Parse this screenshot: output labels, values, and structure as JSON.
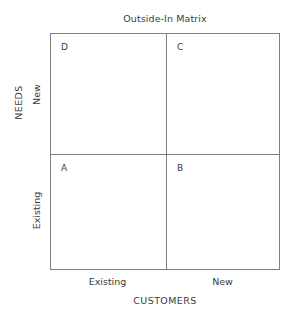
{
  "chart_data": {
    "type": "table",
    "title": "Outside-In Matrix",
    "xlabel": "CUSTOMERS",
    "ylabel": "NEEDS",
    "x_ticks": [
      "Existing",
      "New"
    ],
    "y_ticks": [
      "Existing",
      "New"
    ],
    "grid": true,
    "legend": null,
    "colors": {
      "border": "#808080",
      "text": "#3b3b3b",
      "background": "#ffffff"
    },
    "quadrants": [
      {
        "id": "top-left",
        "label": "D",
        "customers": "Existing",
        "needs": "New"
      },
      {
        "id": "top-right",
        "label": "C",
        "customers": "New",
        "needs": "New"
      },
      {
        "id": "bottom-left",
        "label": "A",
        "customers": "Existing",
        "needs": "Existing"
      },
      {
        "id": "bottom-right",
        "label": "B",
        "customers": "New",
        "needs": "Existing"
      }
    ]
  },
  "chart": {
    "title": "Outside-In Matrix",
    "y_axis": {
      "title": "NEEDS",
      "tick_upper": "New",
      "tick_lower": "Existing"
    },
    "x_axis": {
      "title": "CUSTOMERS",
      "tick_left": "Existing",
      "tick_right": "New"
    },
    "quadrant_labels": {
      "top_left": "D",
      "top_right": "C",
      "bottom_left": "A",
      "bottom_right": "B"
    }
  }
}
